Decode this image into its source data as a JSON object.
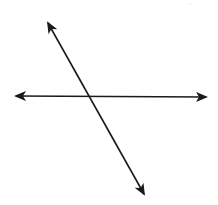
{
  "diagram": {
    "type": "intersecting-lines",
    "stroke_color": "#1a1a1a",
    "background": "#ffffff",
    "lines": [
      {
        "name": "horizontal-line",
        "x1": 16,
        "y1": 96,
        "x2": 206,
        "y2": 97,
        "arrows": "both"
      },
      {
        "name": "transversal-line",
        "x1": 48,
        "y1": 23,
        "x2": 144,
        "y2": 194,
        "arrows": "both"
      }
    ],
    "intersection": {
      "x": 89,
      "y": 96
    }
  }
}
